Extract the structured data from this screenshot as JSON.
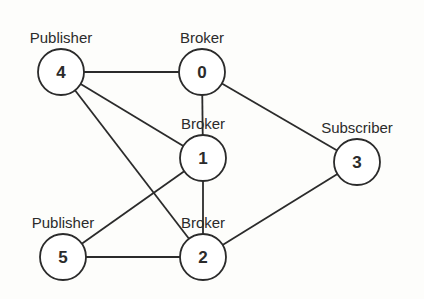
{
  "diagram": {
    "type": "network-graph",
    "nodes": [
      {
        "id": "0",
        "role": "Broker",
        "x": 202,
        "y": 72
      },
      {
        "id": "1",
        "role": "Broker",
        "x": 203,
        "y": 158
      },
      {
        "id": "2",
        "role": "Broker",
        "x": 203,
        "y": 257
      },
      {
        "id": "3",
        "role": "Subscriber",
        "x": 357,
        "y": 162
      },
      {
        "id": "4",
        "role": "Publisher",
        "x": 61,
        "y": 72
      },
      {
        "id": "5",
        "role": "Publisher",
        "x": 63,
        "y": 257
      }
    ],
    "edges": [
      {
        "from": "4",
        "to": "0"
      },
      {
        "from": "4",
        "to": "1"
      },
      {
        "from": "4",
        "to": "2"
      },
      {
        "from": "0",
        "to": "1"
      },
      {
        "from": "0",
        "to": "3"
      },
      {
        "from": "1",
        "to": "2"
      },
      {
        "from": "1",
        "to": "5"
      },
      {
        "from": "5",
        "to": "2"
      },
      {
        "from": "2",
        "to": "3"
      }
    ],
    "node_radius": 23,
    "colors": {
      "stroke": "#2b2b2b",
      "fill": "#ffffff",
      "background": "#fdfdfb"
    }
  }
}
